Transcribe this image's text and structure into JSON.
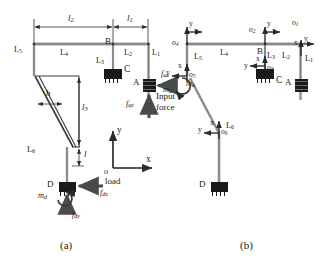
{
  "figure": {
    "caption_a": "(a)",
    "caption_b": "(b)"
  },
  "panel_a": {
    "dimensions": [
      {
        "id": "l2",
        "base": "l",
        "sub": "2"
      },
      {
        "id": "l1",
        "base": "l",
        "sub": "1"
      },
      {
        "id": "l3",
        "base": "l",
        "sub": "3"
      },
      {
        "id": "h",
        "base": "h",
        "sub": ""
      },
      {
        "id": "l",
        "base": "l",
        "sub": ""
      }
    ],
    "links": [
      {
        "id": "L5",
        "base": "L",
        "sub": "5"
      },
      {
        "id": "L4",
        "base": "L",
        "sub": "4"
      },
      {
        "id": "L3",
        "base": "L",
        "sub": "3"
      },
      {
        "id": "L2",
        "base": "L",
        "sub": "2"
      },
      {
        "id": "L1",
        "base": "L",
        "sub": "1"
      },
      {
        "id": "L6",
        "base": "L",
        "sub": "6"
      }
    ],
    "joints": [
      {
        "id": "A",
        "label": "A"
      },
      {
        "id": "B",
        "label": "B"
      },
      {
        "id": "C",
        "label": "C"
      },
      {
        "id": "D",
        "label": "D"
      }
    ],
    "forces": {
      "fax": {
        "base": "f",
        "sub": "ax"
      },
      "fay": {
        "base": "f",
        "sub": "ay"
      },
      "fdx": {
        "base": "f",
        "sub": "dx"
      },
      "fdy": {
        "base": "f",
        "sub": "dy"
      },
      "input_force_line1": "Input",
      "input_force_line2": "force",
      "load": "load"
    },
    "masses": {
      "ma": {
        "base": "m",
        "sub": "a"
      },
      "md": {
        "base": "m",
        "sub": "d"
      }
    },
    "global_frame": {
      "origin": "o",
      "x_axis": "x",
      "y_axis": "y"
    }
  },
  "panel_b": {
    "links": [
      {
        "id": "L5",
        "base": "L",
        "sub": "5"
      },
      {
        "id": "L4",
        "base": "L",
        "sub": "4"
      },
      {
        "id": "L3",
        "base": "L",
        "sub": "3"
      },
      {
        "id": "L2",
        "base": "L",
        "sub": "2"
      },
      {
        "id": "L1",
        "base": "L",
        "sub": "1"
      },
      {
        "id": "L6",
        "base": "L",
        "sub": "6"
      }
    ],
    "joints": [
      {
        "id": "A",
        "label": "A"
      },
      {
        "id": "B",
        "label": "B"
      },
      {
        "id": "C",
        "label": "C"
      },
      {
        "id": "D",
        "label": "D"
      }
    ],
    "frames": [
      {
        "id": "o1",
        "base": "o",
        "sub": "1",
        "x_axis": "x",
        "y_axis": "y"
      },
      {
        "id": "o2",
        "base": "o",
        "sub": "2",
        "x_axis": "x",
        "y_axis": "y"
      },
      {
        "id": "o3",
        "base": "o",
        "sub": "3",
        "x_axis": "x",
        "y_axis": "y"
      },
      {
        "id": "o4",
        "base": "o",
        "sub": "4",
        "x_axis": "x",
        "y_axis": "y"
      },
      {
        "id": "o5",
        "base": "o",
        "sub": "5",
        "x_axis": "x",
        "y_axis": "y"
      },
      {
        "id": "o6",
        "base": "o",
        "sub": "6",
        "x_axis": "x",
        "y_axis": "y"
      }
    ],
    "masses": {
      "ma": {
        "base": "m",
        "sub": "a"
      }
    }
  },
  "colors": {
    "line": "#3a3a3a",
    "link_gray": "#9a9a9a",
    "block": "#1a1a1a",
    "text": "#1a1a1a"
  }
}
